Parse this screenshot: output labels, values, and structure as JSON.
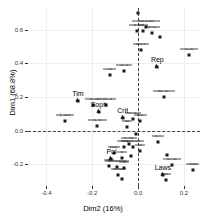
{
  "chart_data": {
    "type": "scatter",
    "title": "",
    "xlabel": "Dim2 (16%)",
    "ylabel": "Dim1 (68.8%)",
    "xlim": [
      -0.48,
      0.27
    ],
    "ylim": [
      -0.33,
      0.73
    ],
    "xticks": [
      -0.4,
      -0.2,
      0.0,
      0.2
    ],
    "xticklabels": [
      "-0.4",
      "-0.2",
      "0.0",
      "0.2"
    ],
    "yticks": [
      -0.2,
      0.0,
      0.2,
      0.4,
      0.6
    ],
    "yticklabels": [
      "-0.2",
      "0.0",
      "0.2",
      "0.4",
      "0.6"
    ],
    "grid": true,
    "legend": "none",
    "reference_lines": [
      {
        "axis": "vertical",
        "value": 0.0,
        "style": "dashed"
      },
      {
        "axis": "horizontal",
        "value": 0.0,
        "style": "dashed"
      }
    ],
    "marker_shapes": [
      "square",
      "triangle"
    ],
    "named_points": [
      {
        "label": "Tim",
        "x": -0.262,
        "y": 0.178
      },
      {
        "label": "Soph",
        "x": -0.171,
        "y": 0.108
      },
      {
        "label": "Crit",
        "x": -0.067,
        "y": 0.072
      },
      {
        "label": "Rep",
        "x": 0.084,
        "y": 0.378
      },
      {
        "label": "Pol",
        "x": -0.116,
        "y": -0.167
      },
      {
        "label": "Laws",
        "x": 0.108,
        "y": -0.262
      }
    ],
    "points": [
      {
        "x": -0.002,
        "y": 0.7,
        "label": "-u-u-"
      },
      {
        "x": 0.035,
        "y": 0.617,
        "label": "-uu-u-uu-"
      },
      {
        "x": -0.006,
        "y": 0.594,
        "label": "-u-u-"
      },
      {
        "x": 0.02,
        "y": 0.592,
        "label": "u"
      },
      {
        "x": 0.062,
        "y": 0.58,
        "label": "u--u-"
      },
      {
        "x": 0.095,
        "y": 0.556,
        "label": ""
      },
      {
        "x": 0.012,
        "y": 0.477,
        "label": "u-u-u"
      },
      {
        "x": 0.222,
        "y": 0.452,
        "label": "-u--u-"
      },
      {
        "x": -0.124,
        "y": 0.33,
        "label": "--u-"
      },
      {
        "x": -0.062,
        "y": 0.355,
        "label": "-u--u"
      },
      {
        "x": 0.084,
        "y": 0.378,
        "label": ""
      },
      {
        "x": 0.112,
        "y": 0.2,
        "label": "uu--u--"
      },
      {
        "x": -0.262,
        "y": 0.178,
        "label": ""
      },
      {
        "x": -0.196,
        "y": 0.15,
        "label": "-u--u"
      },
      {
        "x": -0.138,
        "y": 0.154,
        "label": "-uu--u"
      },
      {
        "x": -0.171,
        "y": 0.108,
        "label": ""
      },
      {
        "x": -0.318,
        "y": 0.058,
        "label": "|--uuu"
      },
      {
        "x": -0.178,
        "y": 0.03,
        "label": "-u--u-"
      },
      {
        "x": -0.067,
        "y": 0.072,
        "label": ""
      },
      {
        "x": -0.022,
        "y": 0.068,
        "label": "u--u-"
      },
      {
        "x": 0.01,
        "y": 0.06,
        "label": "u-u-"
      },
      {
        "x": -0.048,
        "y": 0.02,
        "label": "uu"
      },
      {
        "x": -0.008,
        "y": -0.022,
        "label": ""
      },
      {
        "x": -0.06,
        "y": -0.1,
        "label": "-uuu-"
      },
      {
        "x": -0.04,
        "y": -0.082,
        "label": "u--uu"
      },
      {
        "x": -0.022,
        "y": -0.1,
        "label": "u--u-uu"
      },
      {
        "x": 0.086,
        "y": -0.07,
        "label": "u---"
      },
      {
        "x": 0.01,
        "y": -0.12,
        "label": "u"
      },
      {
        "x": -0.104,
        "y": -0.135,
        "label": "uuu-"
      },
      {
        "x": -0.116,
        "y": -0.167,
        "label": ""
      },
      {
        "x": -0.07,
        "y": -0.165,
        "label": "u"
      },
      {
        "x": -0.03,
        "y": -0.152,
        "label": ""
      },
      {
        "x": 0.124,
        "y": -0.148,
        "label": ""
      },
      {
        "x": 0.148,
        "y": -0.206,
        "label": "u---u-"
      },
      {
        "x": -0.128,
        "y": -0.212,
        "label": "uu"
      },
      {
        "x": -0.092,
        "y": -0.216,
        "label": "uuuuuuuu"
      },
      {
        "x": -0.06,
        "y": -0.222,
        "label": "u"
      },
      {
        "x": 0.238,
        "y": -0.232,
        "label": "-uuu"
      },
      {
        "x": -0.086,
        "y": -0.262,
        "label": "uu-uu"
      },
      {
        "x": -0.072,
        "y": -0.286,
        "label": ""
      },
      {
        "x": 0.108,
        "y": -0.262,
        "label": ""
      },
      {
        "x": 0.122,
        "y": -0.292,
        "label": "-u-"
      }
    ]
  },
  "axes": {
    "x_label": "Dim2 (16%)",
    "y_label": "Dim1 (68.8%)"
  }
}
